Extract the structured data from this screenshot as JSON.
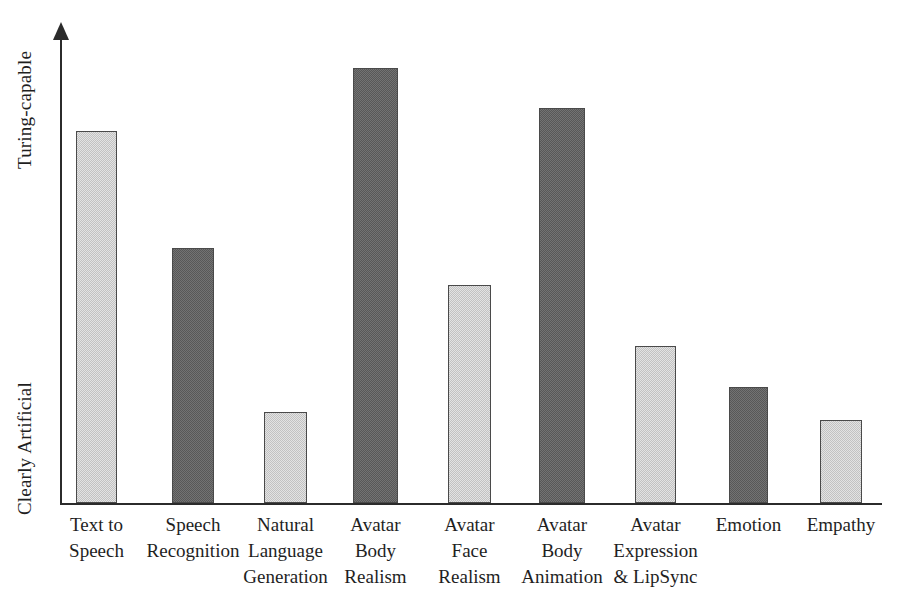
{
  "chart_data": {
    "type": "bar",
    "title": "",
    "xlabel": "",
    "ylabel": "",
    "grid": false,
    "legend": "none",
    "y_axis": {
      "tick_labels": [
        "Clearly Artificial",
        "Turing-capable"
      ],
      "low_label": "Clearly Artificial",
      "high_label": "Turing-capable",
      "ylim": [
        0,
        100
      ],
      "arrow": true
    },
    "categories": [
      "Text to\nSpeech",
      "Speech\nRecognition",
      "Natural\nLanguage\nGeneration",
      "Avatar\nBody\nRealism",
      "Avatar\nFace\nRealism",
      "Avatar\nBody\nAnimation",
      "Avatar\nExpression\n& LipSync",
      "Emotion",
      "Empathy"
    ],
    "values": [
      78,
      54,
      19,
      92,
      46,
      83,
      33,
      24,
      17
    ],
    "bar_colors": [
      "#c2c2c2",
      "#585858",
      "#c2c2c2",
      "#585858",
      "#c2c2c2",
      "#585858",
      "#c2c2c2",
      "#585858",
      "#c2c2c2"
    ],
    "bar_shades": [
      "light",
      "dark",
      "light",
      "dark",
      "light",
      "dark",
      "light",
      "dark",
      "light"
    ],
    "geometry": {
      "baseline_y": 503,
      "axis_top_y": 28,
      "bar_tops_px": [
        131,
        248,
        412,
        68,
        285,
        108,
        346,
        387,
        420
      ],
      "bar_lefts_px": [
        76,
        172,
        264,
        353,
        448,
        539,
        635,
        729,
        820
      ],
      "bar_widths_px": [
        41,
        42,
        43,
        45,
        43,
        46,
        41,
        39,
        42
      ]
    }
  },
  "palette": {
    "light_bar": "#c2c2c2",
    "dark_bar": "#585858",
    "axis": "#2b2b2b",
    "text": "#1f1f1f",
    "background": "#ffffff"
  }
}
